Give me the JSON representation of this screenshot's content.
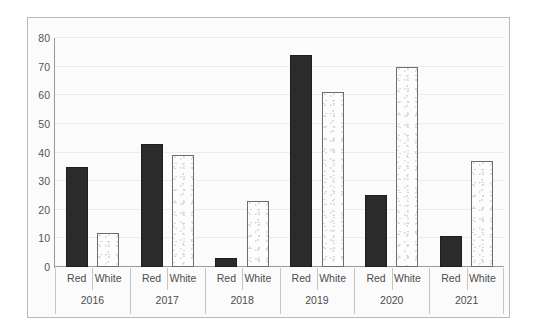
{
  "chart_data": {
    "type": "bar",
    "title": "",
    "subtitle": "",
    "xlabel": "",
    "ylabel": "",
    "ylim": [
      0,
      80
    ],
    "yticks": [
      0,
      10,
      20,
      30,
      40,
      50,
      60,
      70,
      80
    ],
    "grid": true,
    "legend": "none",
    "categories": [
      "2016",
      "2017",
      "2018",
      "2019",
      "2020",
      "2021"
    ],
    "subcategories": [
      "Red",
      "White"
    ],
    "series": [
      {
        "name": "Red",
        "values": [
          35,
          43,
          3,
          74,
          25,
          11
        ],
        "color": "#2b2b2b"
      },
      {
        "name": "White",
        "values": [
          12,
          39,
          23,
          61,
          70,
          37
        ],
        "color": "#fdfdfd"
      }
    ],
    "groups": [
      {
        "year": "2016",
        "bars": [
          {
            "label": "Red",
            "value": 35,
            "style": "red"
          },
          {
            "label": "White",
            "value": 12,
            "style": "white"
          }
        ]
      },
      {
        "year": "2017",
        "bars": [
          {
            "label": "Red",
            "value": 43,
            "style": "red"
          },
          {
            "label": "White",
            "value": 39,
            "style": "white"
          }
        ]
      },
      {
        "year": "2018",
        "bars": [
          {
            "label": "Red",
            "value": 3,
            "style": "red"
          },
          {
            "label": "White",
            "value": 23,
            "style": "white"
          }
        ]
      },
      {
        "year": "2019",
        "bars": [
          {
            "label": "Red",
            "value": 74,
            "style": "red"
          },
          {
            "label": "White",
            "value": 61,
            "style": "white"
          }
        ]
      },
      {
        "year": "2020",
        "bars": [
          {
            "label": "Red",
            "value": 25,
            "style": "red"
          },
          {
            "label": "White",
            "value": 70,
            "style": "white"
          }
        ]
      },
      {
        "year": "2021",
        "bars": [
          {
            "label": "Red",
            "value": 11,
            "style": "red"
          },
          {
            "label": "White",
            "value": 37,
            "style": "white"
          }
        ]
      }
    ],
    "colors": {
      "red_bar": "#2b2b2b",
      "white_bar_fill": "#fdfdfd",
      "white_bar_border": "#6d6d6d",
      "gridline": "#ececec",
      "axis": "#9a9a9a",
      "frame_border": "#b9b9b9",
      "plot_background": "#fbfbfb",
      "tick_text": "#555555"
    }
  }
}
